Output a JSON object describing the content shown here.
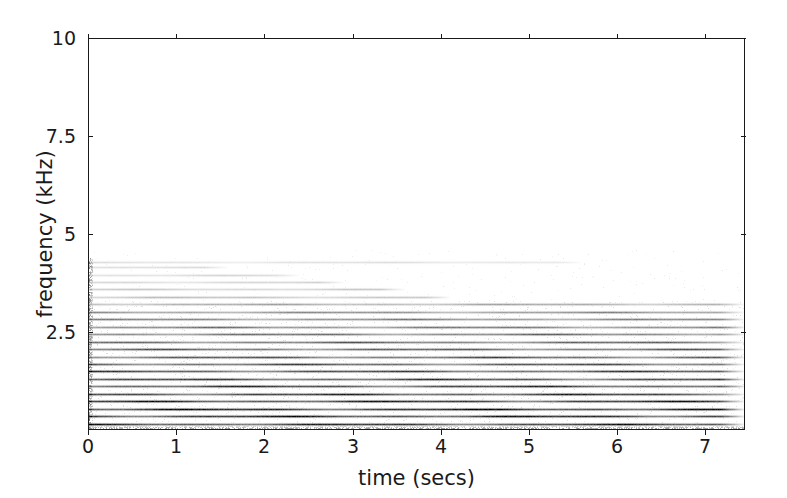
{
  "figure": {
    "width": 787,
    "height": 498,
    "background_color": "#ffffff",
    "axis_color": "#1a1a1a",
    "text_color": "#1a1a1a"
  },
  "axes": {
    "left_px": 88,
    "top_px": 38,
    "width_px": 657,
    "height_px": 392
  },
  "chart_data": {
    "type": "heatmap",
    "subtype": "spectrogram",
    "title": "",
    "xlabel": "time (secs)",
    "ylabel": "frequency (kHz)",
    "xlim": [
      0,
      7.45
    ],
    "ylim": [
      0,
      10
    ],
    "xticks": [
      0,
      1,
      2,
      3,
      4,
      5,
      6,
      7
    ],
    "xticklabels": [
      "0",
      "1",
      "2",
      "3",
      "4",
      "5",
      "6",
      "7"
    ],
    "yticks": [
      2.5,
      5,
      7.5,
      10
    ],
    "yticklabels": [
      "2.5",
      "5",
      "7.5",
      "10"
    ],
    "grid": false,
    "legend": null,
    "colormap": "gray_r",
    "harmonic_fundamental_khz": 0.19,
    "harmonic_count": 23,
    "strong_harmonics_upper_khz": 3.2,
    "faint_harmonics_upper_khz": 4.3,
    "harmonics": [
      {
        "index": 1,
        "freq_khz": 0.19,
        "intensity": 0.82,
        "t_end": 7.45
      },
      {
        "index": 2,
        "freq_khz": 0.38,
        "intensity": 0.86,
        "t_end": 7.45
      },
      {
        "index": 3,
        "freq_khz": 0.57,
        "intensity": 0.88,
        "t_end": 7.45
      },
      {
        "index": 4,
        "freq_khz": 0.76,
        "intensity": 0.84,
        "t_end": 7.45
      },
      {
        "index": 5,
        "freq_khz": 0.95,
        "intensity": 0.8,
        "t_end": 7.45
      },
      {
        "index": 6,
        "freq_khz": 1.14,
        "intensity": 0.78,
        "t_end": 7.45
      },
      {
        "index": 7,
        "freq_khz": 1.33,
        "intensity": 0.74,
        "t_end": 7.45
      },
      {
        "index": 8,
        "freq_khz": 1.52,
        "intensity": 0.72,
        "t_end": 7.45
      },
      {
        "index": 9,
        "freq_khz": 1.71,
        "intensity": 0.68,
        "t_end": 7.45
      },
      {
        "index": 10,
        "freq_khz": 1.9,
        "intensity": 0.66,
        "t_end": 7.45
      },
      {
        "index": 11,
        "freq_khz": 2.09,
        "intensity": 0.62,
        "t_end": 7.45
      },
      {
        "index": 12,
        "freq_khz": 2.28,
        "intensity": 0.6,
        "t_end": 7.45
      },
      {
        "index": 13,
        "freq_khz": 2.47,
        "intensity": 0.56,
        "t_end": 7.45
      },
      {
        "index": 14,
        "freq_khz": 2.66,
        "intensity": 0.52,
        "t_end": 7.45
      },
      {
        "index": 15,
        "freq_khz": 2.85,
        "intensity": 0.48,
        "t_end": 7.45
      },
      {
        "index": 16,
        "freq_khz": 3.04,
        "intensity": 0.44,
        "t_end": 7.45
      },
      {
        "index": 17,
        "freq_khz": 3.23,
        "intensity": 0.34,
        "t_end": 7.45
      },
      {
        "index": 18,
        "freq_khz": 3.42,
        "intensity": 0.24,
        "t_end": 4.1
      },
      {
        "index": 19,
        "freq_khz": 3.61,
        "intensity": 0.2,
        "t_end": 3.6
      },
      {
        "index": 20,
        "freq_khz": 3.8,
        "intensity": 0.17,
        "t_end": 2.9
      },
      {
        "index": 21,
        "freq_khz": 3.99,
        "intensity": 0.15,
        "t_end": 2.4
      },
      {
        "index": 22,
        "freq_khz": 4.18,
        "intensity": 0.13,
        "t_end": 1.6
      },
      {
        "index": 23,
        "freq_khz": 4.3,
        "intensity": 0.12,
        "t_end": 5.6
      }
    ],
    "noise_floor_band_khz": [
      0.0,
      0.12
    ]
  }
}
